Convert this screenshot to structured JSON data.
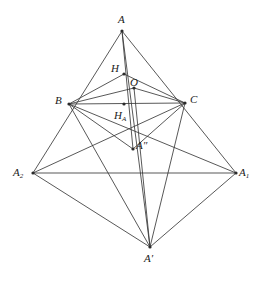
{
  "figure": {
    "width": 265,
    "height": 282,
    "background_color": "#ffffff",
    "stroke_color": "#3a3a3a",
    "label_color": "#1a1a1a",
    "points": [
      {
        "id": "A",
        "label": "A",
        "label_html": "A",
        "x": 122,
        "y": 31,
        "label_x": 118,
        "label_y": 14,
        "dot": true
      },
      {
        "id": "H",
        "label": "H",
        "label_html": "H",
        "x": 124,
        "y": 74,
        "label_x": 111,
        "label_y": 63,
        "dot": true
      },
      {
        "id": "O",
        "label": "O",
        "label_html": "O",
        "x": 134,
        "y": 88,
        "label_x": 130,
        "label_y": 77,
        "dot": true
      },
      {
        "id": "B",
        "label": "B",
        "label_html": "B",
        "x": 69,
        "y": 104,
        "label_x": 55,
        "label_y": 95,
        "dot": true
      },
      {
        "id": "C",
        "label": "C",
        "label_html": "C",
        "x": 185,
        "y": 103,
        "label_x": 190,
        "label_y": 94,
        "dot": true
      },
      {
        "id": "HA",
        "label": "H_A",
        "label_html": "H<sub>A</sub>",
        "x": 124,
        "y": 104,
        "label_x": 114,
        "label_y": 110,
        "dot": true
      },
      {
        "id": "App",
        "label": "A''",
        "label_html": "A&#8243;",
        "x": 133,
        "y": 149,
        "label_x": 136,
        "label_y": 140,
        "dot": true
      },
      {
        "id": "A2",
        "label": "A_2",
        "label_html": "A<sub>2</sub>",
        "x": 33,
        "y": 173,
        "label_x": 13,
        "label_y": 167,
        "dot": true
      },
      {
        "id": "A1",
        "label": "A_1",
        "label_html": "A<sub>1</sub>",
        "x": 236,
        "y": 173,
        "label_x": 239,
        "label_y": 167,
        "dot": true
      },
      {
        "id": "Ap",
        "label": "A'",
        "label_html": "A&#8242;",
        "x": 150,
        "y": 247,
        "label_x": 144,
        "label_y": 253,
        "dot": true
      }
    ],
    "edges": [
      {
        "from": "A",
        "to": "A2",
        "name": "edge-A-A2"
      },
      {
        "from": "A",
        "to": "A1",
        "name": "edge-A-A1"
      },
      {
        "from": "A",
        "to": "Ap",
        "name": "edge-A-Aprime"
      },
      {
        "from": "A",
        "to": "App",
        "name": "edge-A-Adoubleprime"
      },
      {
        "from": "H",
        "to": "B",
        "name": "edge-H-B"
      },
      {
        "from": "H",
        "to": "C",
        "name": "edge-H-C"
      },
      {
        "from": "O",
        "to": "B",
        "name": "edge-O-B"
      },
      {
        "from": "O",
        "to": "C",
        "name": "edge-O-C"
      },
      {
        "from": "O",
        "to": "Ap",
        "name": "edge-O-Aprime"
      },
      {
        "from": "B",
        "to": "C",
        "name": "edge-B-C"
      },
      {
        "from": "B",
        "to": "App",
        "name": "edge-B-Adoubleprime"
      },
      {
        "from": "C",
        "to": "App",
        "name": "edge-C-Adoubleprime"
      },
      {
        "from": "B",
        "to": "A1",
        "name": "edge-B-A1"
      },
      {
        "from": "C",
        "to": "A2",
        "name": "edge-C-A2"
      },
      {
        "from": "B",
        "to": "Ap",
        "name": "edge-B-Aprime"
      },
      {
        "from": "C",
        "to": "Ap",
        "name": "edge-C-Aprime"
      },
      {
        "from": "A2",
        "to": "A1",
        "name": "edge-A2-A1"
      },
      {
        "from": "A2",
        "to": "Ap",
        "name": "edge-A2-Aprime"
      },
      {
        "from": "A1",
        "to": "Ap",
        "name": "edge-A1-Aprime"
      }
    ]
  }
}
